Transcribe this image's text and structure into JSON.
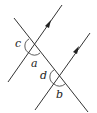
{
  "diagram": {
    "type": "parallel-lines-transversal",
    "stroke_color": "#333333",
    "labels": {
      "a": "a",
      "b": "b",
      "c": "c",
      "d": "d"
    }
  }
}
